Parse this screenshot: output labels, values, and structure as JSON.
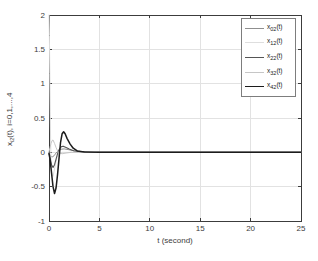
{
  "window": {
    "width": 318,
    "height": 261,
    "background": "#ffffff"
  },
  "chart_data": {
    "type": "line",
    "title": "",
    "xlabel": "t (second)",
    "ylabel": "x_{i2}(t), i=0,1,...,4",
    "ylabel_parts": {
      "base": "x",
      "sub": "i2",
      "suffix": "(t), i=0,1,...,4"
    },
    "xlim": [
      0,
      25
    ],
    "ylim": [
      -1,
      2
    ],
    "xticks": [
      0,
      5,
      10,
      15,
      20,
      25
    ],
    "yticks": [
      -1,
      -0.5,
      0,
      0.5,
      1,
      1.5,
      2
    ],
    "grid": true,
    "legend_position": "top-right",
    "axis_color": "#3c3c3c",
    "grid_color": "#e2e2e2",
    "tick_label_color": "#3c3c3c",
    "series": [
      {
        "name": "x_02(t)",
        "label_parts": {
          "base": "x",
          "sub": "02",
          "suffix": "(t)"
        },
        "color": "#8f8f8f",
        "line_width": 1,
        "points": [
          [
            0,
            0
          ],
          [
            0.15,
            -0.05
          ],
          [
            0.3,
            -0.07
          ],
          [
            0.5,
            -0.05
          ],
          [
            0.7,
            -0.01
          ],
          [
            0.9,
            0.02
          ],
          [
            1.2,
            0.045
          ],
          [
            1.5,
            0.05
          ],
          [
            1.9,
            0.04
          ],
          [
            2.4,
            0.025
          ],
          [
            3,
            0.012
          ],
          [
            4,
            0.004
          ],
          [
            5,
            0
          ],
          [
            25,
            0
          ]
        ]
      },
      {
        "name": "x_12(t)",
        "label_parts": {
          "base": "x",
          "sub": "12",
          "suffix": "(t)"
        },
        "color": "#dedede",
        "line_width": 1,
        "points": [
          [
            0,
            2
          ],
          [
            0.04,
            1.7
          ],
          [
            0.08,
            1.15
          ],
          [
            0.12,
            0.6
          ],
          [
            0.16,
            0.15
          ],
          [
            0.22,
            -0.18
          ],
          [
            0.3,
            -0.32
          ],
          [
            0.4,
            -0.35
          ],
          [
            0.5,
            -0.28
          ],
          [
            0.65,
            -0.16
          ],
          [
            0.8,
            -0.07
          ],
          [
            1,
            -0.02
          ],
          [
            1.3,
            0
          ],
          [
            25,
            0
          ]
        ]
      },
      {
        "name": "x_22(t)",
        "label_parts": {
          "base": "x",
          "sub": "22",
          "suffix": "(t)"
        },
        "color": "#555555",
        "line_width": 1.1,
        "points": [
          [
            0,
            -0.01
          ],
          [
            0.1,
            -0.08
          ],
          [
            0.25,
            -0.18
          ],
          [
            0.4,
            -0.22
          ],
          [
            0.55,
            -0.18
          ],
          [
            0.7,
            -0.1
          ],
          [
            0.85,
            -0.02
          ],
          [
            1,
            0.04
          ],
          [
            1.2,
            0.08
          ],
          [
            1.4,
            0.09
          ],
          [
            1.7,
            0.07
          ],
          [
            2,
            0.05
          ],
          [
            2.5,
            0.02
          ],
          [
            3.2,
            0.01
          ],
          [
            4.5,
            0
          ],
          [
            25,
            0
          ]
        ]
      },
      {
        "name": "x_32(t)",
        "label_parts": {
          "base": "x",
          "sub": "32",
          "suffix": "(t)"
        },
        "color": "#c6c6c6",
        "line_width": 1,
        "points": [
          [
            0,
            0.01
          ],
          [
            0.1,
            0.07
          ],
          [
            0.2,
            0.13
          ],
          [
            0.3,
            0.17
          ],
          [
            0.4,
            0.18
          ],
          [
            0.55,
            0.13
          ],
          [
            0.7,
            0.07
          ],
          [
            0.85,
            0.02
          ],
          [
            1,
            -0.01
          ],
          [
            1.3,
            -0.02
          ],
          [
            1.7,
            -0.01
          ],
          [
            2.2,
            0
          ],
          [
            25,
            0
          ]
        ]
      },
      {
        "name": "x_42(t)",
        "label_parts": {
          "base": "x",
          "sub": "42",
          "suffix": "(t)"
        },
        "color": "#1c1c1c",
        "line_width": 1.5,
        "points": [
          [
            0,
            -0.02
          ],
          [
            0.1,
            -0.1
          ],
          [
            0.25,
            -0.3
          ],
          [
            0.4,
            -0.5
          ],
          [
            0.55,
            -0.6
          ],
          [
            0.7,
            -0.52
          ],
          [
            0.85,
            -0.32
          ],
          [
            1,
            -0.08
          ],
          [
            1.15,
            0.15
          ],
          [
            1.3,
            0.27
          ],
          [
            1.45,
            0.3
          ],
          [
            1.6,
            0.27
          ],
          [
            1.8,
            0.2
          ],
          [
            2.1,
            0.12
          ],
          [
            2.4,
            0.06
          ],
          [
            2.8,
            0.02
          ],
          [
            3.5,
            0.005
          ],
          [
            5,
            0
          ],
          [
            25,
            0
          ]
        ]
      }
    ]
  }
}
